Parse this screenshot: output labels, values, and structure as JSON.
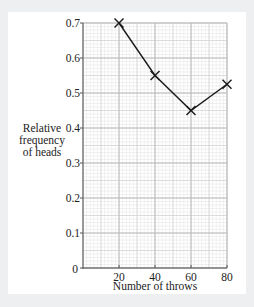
{
  "chart_data": {
    "type": "line",
    "title": "",
    "xlabel": "Number of throws",
    "ylabel": "Relative frequency of heads",
    "ylabel_lines": [
      "Relative",
      "frequency",
      "of heads"
    ],
    "x": [
      20,
      40,
      60,
      80
    ],
    "series": [
      {
        "name": "Relative frequency of heads",
        "values": [
          0.7,
          0.55,
          0.45,
          0.525
        ],
        "marker": "x"
      }
    ],
    "xlim": [
      0,
      80
    ],
    "ylim": [
      0,
      0.7
    ],
    "xticks": [
      20,
      40,
      60,
      80
    ],
    "xtick_labels": [
      "20",
      "40",
      "60",
      "80"
    ],
    "yticks": [
      0,
      0.1,
      0.2,
      0.3,
      0.4,
      0.5,
      0.6,
      0.7
    ],
    "ytick_labels": [
      "0",
      "0.1",
      "0.2",
      "0.3",
      "0.4",
      "0.5",
      "0.6",
      "0.7"
    ],
    "grid": true,
    "grid_style": "graph paper (major every 20 / 0.1, minor every 2 / 0.01)",
    "legend": "none"
  },
  "colors": {
    "background": "#eeeff1",
    "card": "#ffffff",
    "grid_minor": "#e2e2e2",
    "grid_major": "#b8b8b8",
    "axis": "#555555",
    "line": "#1a1a1a"
  }
}
